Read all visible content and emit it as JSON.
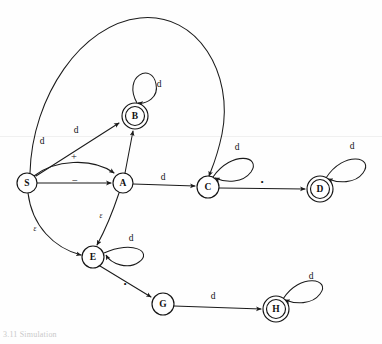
{
  "figure": {
    "domain_type": "diagram",
    "kind": "finite-state-transition-diagram",
    "width": 382,
    "height": 344,
    "background_color": "#fefefe",
    "stroke_color": "#1b1b1b",
    "caption": "3.11   Simulation"
  },
  "states": [
    {
      "id": "S",
      "label": "S",
      "accepting": false,
      "cx": 27,
      "cy": 183,
      "r": 10
    },
    {
      "id": "B",
      "label": "B",
      "accepting": true,
      "cx": 135,
      "cy": 116,
      "r": 13
    },
    {
      "id": "A",
      "label": "A",
      "accepting": false,
      "cx": 123,
      "cy": 183,
      "r": 10
    },
    {
      "id": "C",
      "label": "C",
      "accepting": false,
      "cx": 208,
      "cy": 187,
      "r": 11
    },
    {
      "id": "D",
      "label": "D",
      "accepting": true,
      "cx": 320,
      "cy": 189,
      "r": 13
    },
    {
      "id": "E",
      "label": "E",
      "accepting": false,
      "cx": 93,
      "cy": 257,
      "r": 11
    },
    {
      "id": "G",
      "label": "G",
      "accepting": false,
      "cx": 163,
      "cy": 304,
      "r": 11
    },
    {
      "id": "H",
      "label": "H",
      "accepting": true,
      "cx": 276,
      "cy": 309,
      "r": 13
    }
  ],
  "transitions": [
    {
      "id": "t-s-c",
      "from": "S",
      "to": "C",
      "label": "d",
      "label_x": 42,
      "label_y": 141,
      "label_kind": "plain"
    },
    {
      "id": "t-s-b",
      "from": "S",
      "to": "B",
      "label": "d",
      "label_x": 76,
      "label_y": 130,
      "label_kind": "plain"
    },
    {
      "id": "t-s-a1",
      "from": "S",
      "to": "A",
      "label": "+",
      "label_x": 74,
      "label_y": 156,
      "label_kind": "sym"
    },
    {
      "id": "t-s-a2",
      "from": "S",
      "to": "A",
      "label": "−",
      "label_x": 75,
      "label_y": 180,
      "label_kind": "sym"
    },
    {
      "id": "t-s-e",
      "from": "S",
      "to": "E",
      "label": "ε",
      "label_x": 35,
      "label_y": 228,
      "label_kind": "eps"
    },
    {
      "id": "t-b-b",
      "from": "B",
      "to": "B",
      "label": "d",
      "label_x": 159,
      "label_y": 84,
      "label_kind": "plain"
    },
    {
      "id": "t-a-b",
      "from": "A",
      "to": "B",
      "label": "",
      "label_x": 0,
      "label_y": 0,
      "label_kind": "plain"
    },
    {
      "id": "t-a-c",
      "from": "A",
      "to": "C",
      "label": "d",
      "label_x": 163,
      "label_y": 177,
      "label_kind": "plain"
    },
    {
      "id": "t-a-e",
      "from": "A",
      "to": "E",
      "label": "ε",
      "label_x": 101,
      "label_y": 215,
      "label_kind": "eps"
    },
    {
      "id": "t-c-c",
      "from": "C",
      "to": "C",
      "label": "d",
      "label_x": 237,
      "label_y": 147,
      "label_kind": "plain"
    },
    {
      "id": "t-c-d",
      "from": "C",
      "to": "D",
      "label": ".",
      "label_x": 262,
      "label_y": 178,
      "label_kind": "dot"
    },
    {
      "id": "t-d-d",
      "from": "D",
      "to": "D",
      "label": "d",
      "label_x": 352,
      "label_y": 146,
      "label_kind": "plain"
    },
    {
      "id": "t-e-e",
      "from": "E",
      "to": "E",
      "label": "d",
      "label_x": 131,
      "label_y": 238,
      "label_kind": "plain"
    },
    {
      "id": "t-e-g",
      "from": "E",
      "to": "G",
      "label": ".",
      "label_x": 125,
      "label_y": 280,
      "label_kind": "dot"
    },
    {
      "id": "t-g-h",
      "from": "G",
      "to": "H",
      "label": "d",
      "label_x": 213,
      "label_y": 296,
      "label_kind": "plain"
    },
    {
      "id": "t-h-h",
      "from": "H",
      "to": "H",
      "label": "d",
      "label_x": 311,
      "label_y": 276,
      "label_kind": "plain"
    }
  ]
}
